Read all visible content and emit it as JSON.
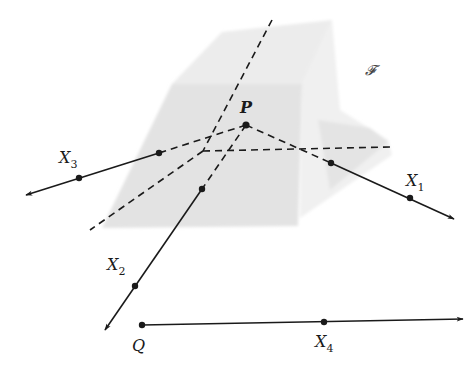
{
  "figure": {
    "plane_label": "𝓕",
    "colors": {
      "line": "#1a1a1a",
      "plane_light": "#e6e6e6",
      "plane_dark": "#dcdcdc",
      "background": "#ffffff"
    }
  },
  "points": {
    "P": {
      "label": "P",
      "x": 246,
      "y": 125
    },
    "Q": {
      "label": "Q",
      "x": 142,
      "y": 325
    },
    "X1": {
      "label": "X",
      "sub": "1",
      "x": 410,
      "y": 198
    },
    "X2": {
      "label": "X",
      "sub": "2",
      "x": 135,
      "y": 286
    },
    "X3": {
      "label": "X",
      "sub": "3",
      "x": 79,
      "y": 178
    },
    "X4": {
      "label": "X",
      "sub": "4",
      "x": 324,
      "y": 322
    }
  },
  "labels": {
    "P": "P",
    "Q": "Q",
    "X1_main": "X",
    "X1_sub": "1",
    "X2_main": "X",
    "X2_sub": "2",
    "X3_main": "X",
    "X3_sub": "3",
    "X4_main": "X",
    "X4_sub": "4",
    "plane": "𝓕"
  }
}
